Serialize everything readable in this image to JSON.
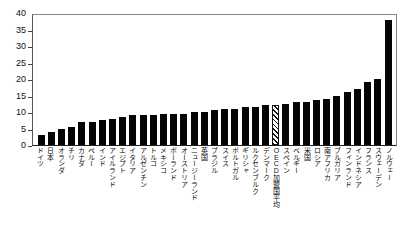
{
  "chart_data": {
    "type": "bar",
    "title": "",
    "xlabel": "",
    "ylabel": "",
    "ylim": [
      0,
      40
    ],
    "ytick_step": 5,
    "yticks": [
      "40",
      "35",
      "30",
      "25",
      "20",
      "15",
      "10",
      "5",
      "0"
    ],
    "grid": false,
    "legend": "none",
    "bar_color": "#050505",
    "highlight_color": "#ffffff",
    "highlight_pattern": "diagonal-hatch",
    "categories": [
      "ドイツ",
      "日本",
      "オランダ",
      "チリ",
      "カナダ",
      "ペルー",
      "インド",
      "アイルランド",
      "エジプト",
      "イタリア",
      "アルゼンチン",
      "トルコ",
      "メキシコ",
      "ポーランド",
      "オーストリア",
      "ニュージーランド",
      "英国",
      "ブラジル",
      "スイス",
      "ポルトガル",
      "ギリシャ",
      "ルクセンブルク",
      "デンマーク",
      "OECD加盟国平均",
      "スペイン",
      "ベルギー",
      "米国",
      "ロシア",
      "南アフリカ",
      "ブルガリア",
      "フィンランド",
      "インドネシア",
      "フランス",
      "スウェーデン",
      "ノルウェー"
    ],
    "values": [
      3,
      4,
      5,
      5.5,
      7,
      7,
      7.5,
      8,
      8.5,
      9,
      9,
      9,
      9.5,
      9.5,
      9.5,
      10,
      10,
      10.5,
      11,
      11,
      11.5,
      11.5,
      12,
      12,
      12.5,
      13,
      13,
      13.5,
      14,
      15,
      16,
      17,
      19,
      20,
      38
    ],
    "highlight_index": 23
  }
}
